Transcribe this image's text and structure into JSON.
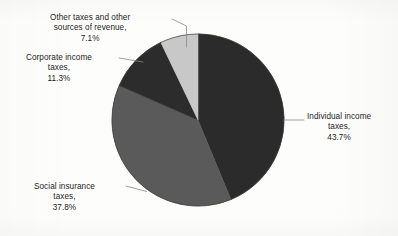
{
  "figure": {
    "background_color": "#fdfdfc",
    "text_color": "#1d1d1d",
    "leader_line_color": "#8a8a8a"
  },
  "chart_data": {
    "type": "pie",
    "title": "",
    "subtitle": "",
    "xlabel": "",
    "ylabel": "",
    "grid": false,
    "legend_position": "none",
    "label_style": "outside-with-leader-lines",
    "units": "percent",
    "total": 99.9,
    "start_angle_deg": 0,
    "direction": "clockwise",
    "categories": [
      "Individual income taxes",
      "Social insurance taxes",
      "Corporate income taxes",
      "Other taxes and other sources of revenue"
    ],
    "values": [
      43.7,
      37.8,
      11.3,
      7.1
    ],
    "colors": [
      "#2b2b2b",
      "#5a5a5a",
      "#2c2c2c",
      "#c8c8c8"
    ],
    "slices": [
      {
        "name": "Individual income taxes",
        "value": 43.7,
        "value_text": "43.7%",
        "color": "#2b2b2b",
        "start_angle_deg": 0,
        "end_angle_deg": 157.32,
        "label_lines": [
          "Individual income",
          "taxes,",
          "43.7%"
        ]
      },
      {
        "name": "Social insurance taxes",
        "value": 37.8,
        "value_text": "37.8%",
        "color": "#5a5a5a",
        "start_angle_deg": 157.32,
        "end_angle_deg": 293.4,
        "label_lines": [
          "Social insurance",
          "taxes,",
          "37.8%"
        ]
      },
      {
        "name": "Corporate income taxes",
        "value": 11.3,
        "value_text": "11.3%",
        "color": "#2c2c2c",
        "start_angle_deg": 293.4,
        "end_angle_deg": 334.08,
        "label_lines": [
          "Corporate income",
          "taxes,",
          "11.3%"
        ]
      },
      {
        "name": "Other taxes and other sources of revenue",
        "value": 7.1,
        "value_text": "7.1%",
        "color": "#c8c8c8",
        "start_angle_deg": 334.08,
        "end_angle_deg": 359.64,
        "label_lines": [
          "Other taxes and other",
          "sources of revenue,",
          "7.1%"
        ]
      }
    ]
  },
  "labels": {
    "individual": {
      "line1": "Individual income",
      "line2": "taxes,",
      "line3": "43.7%"
    },
    "social": {
      "line1": "Social insurance",
      "line2": "taxes,",
      "line3": "37.8%"
    },
    "corporate": {
      "line1": "Corporate income",
      "line2": "taxes,",
      "line3": "11.3%"
    },
    "other": {
      "line1": "Other taxes and other",
      "line2": "sources of revenue,",
      "line3": "7.1%"
    }
  }
}
